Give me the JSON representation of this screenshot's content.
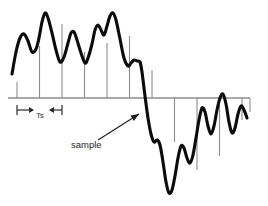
{
  "figure": {
    "background_color": "#ffffff",
    "waveform_color": "#0b0b0b",
    "axis_color": "#8c8c8c",
    "sample_line_color": "#8c8c8c",
    "annotation_color": "#1f1f1f"
  },
  "labels": {
    "sample": "sample",
    "sampling_period": "Ts"
  },
  "axis": {
    "name": "time-axis",
    "y": 98,
    "x_start": 8,
    "x_end": 250
  },
  "annotations": {
    "sample_leader": {
      "name": "sample-leader-arrow",
      "from_x": 98,
      "from_y": 140,
      "to_x": 139,
      "to_y": 114
    },
    "ts_bracket": {
      "name": "ts-dimension",
      "left_x": 17,
      "right_x": 62,
      "y": 110
    }
  },
  "chart_data": {
    "type": "line",
    "xlabel": "",
    "ylabel": "",
    "grid": false,
    "legend": null,
    "axis_baseline_y": 98,
    "note": "Continuous analog signal with vertical sample lines drawn at a uniform sampling interval Ts.",
    "sample_interval_px": 22.5,
    "sample_lines": [
      {
        "x": 17,
        "y_top": 82,
        "y_bottom": 98
      },
      {
        "x": 39.5,
        "y_top": 46,
        "y_bottom": 98
      },
      {
        "x": 62,
        "y_top": 24,
        "y_bottom": 98
      },
      {
        "x": 84.5,
        "y_top": 52,
        "y_bottom": 98
      },
      {
        "x": 107,
        "y_top": 43,
        "y_bottom": 98
      },
      {
        "x": 129.5,
        "y_top": 36,
        "y_bottom": 98
      },
      {
        "x": 152,
        "y_top": 70,
        "y_bottom": 98
      },
      {
        "x": 174.5,
        "y_top": 98,
        "y_bottom": 142
      },
      {
        "x": 197,
        "y_top": 98,
        "y_bottom": 170
      },
      {
        "x": 219.5,
        "y_top": 98,
        "y_bottom": 156
      },
      {
        "x": 242,
        "y_top": 98,
        "y_bottom": 120
      },
      {
        "x": 250,
        "y_top": 98,
        "y_bottom": 112
      }
    ],
    "waveform_points": [
      [
        12,
        74
      ],
      [
        16,
        52
      ],
      [
        20,
        38
      ],
      [
        24,
        34
      ],
      [
        28,
        41
      ],
      [
        32,
        52
      ],
      [
        36,
        49
      ],
      [
        39,
        38
      ],
      [
        42,
        22
      ],
      [
        45,
        13
      ],
      [
        48,
        18
      ],
      [
        52,
        33
      ],
      [
        56,
        50
      ],
      [
        60,
        62
      ],
      [
        64,
        57
      ],
      [
        68,
        43
      ],
      [
        71,
        33
      ],
      [
        74,
        32
      ],
      [
        77,
        40
      ],
      [
        81,
        53
      ],
      [
        85,
        63
      ],
      [
        88,
        58
      ],
      [
        92,
        44
      ],
      [
        95,
        30
      ],
      [
        98,
        25
      ],
      [
        101,
        30
      ],
      [
        104,
        35
      ],
      [
        107,
        26
      ],
      [
        110,
        16
      ],
      [
        113,
        13
      ],
      [
        116,
        20
      ],
      [
        120,
        39
      ],
      [
        124,
        58
      ],
      [
        128,
        66
      ],
      [
        131,
        63
      ],
      [
        134,
        60
      ],
      [
        137,
        61
      ],
      [
        140,
        62
      ],
      [
        142,
        72
      ],
      [
        145,
        96
      ],
      [
        148,
        118
      ],
      [
        151,
        134
      ],
      [
        154,
        142
      ],
      [
        157,
        140
      ],
      [
        160,
        145
      ],
      [
        163,
        162
      ],
      [
        166,
        182
      ],
      [
        169,
        193
      ],
      [
        172,
        190
      ],
      [
        175,
        176
      ],
      [
        178,
        158
      ],
      [
        181,
        146
      ],
      [
        184,
        148
      ],
      [
        187,
        158
      ],
      [
        190,
        163
      ],
      [
        193,
        155
      ],
      [
        196,
        138
      ],
      [
        199,
        120
      ],
      [
        202,
        108
      ],
      [
        205,
        112
      ],
      [
        208,
        126
      ],
      [
        211,
        134
      ],
      [
        214,
        126
      ],
      [
        217,
        110
      ],
      [
        220,
        98
      ],
      [
        223,
        94
      ],
      [
        226,
        104
      ],
      [
        229,
        122
      ],
      [
        232,
        133
      ],
      [
        235,
        128
      ],
      [
        238,
        114
      ],
      [
        241,
        106
      ],
      [
        244,
        110
      ],
      [
        247,
        118
      ]
    ],
    "xlim": [
      0,
      268
    ],
    "ylim": [
      0,
      206
    ]
  }
}
